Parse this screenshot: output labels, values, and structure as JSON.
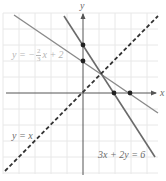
{
  "diagram": {
    "type": "coordinate-plane-linear-graphs",
    "axes": {
      "x_label": "x",
      "y_label": "y"
    },
    "grid": {
      "on": true,
      "color": "#e6e6e6"
    },
    "colors": {
      "axis": "#555555",
      "line_solid": "#6a6a6a",
      "line_dashed": "#333333",
      "point": "#222222"
    },
    "lines": [
      {
        "id": "line1",
        "equation_label": {
          "prefix": "y = −",
          "frac_num": "2",
          "frac_den": "3",
          "suffix": "x + 2"
        },
        "style": "solid",
        "slope": -0.6667,
        "intercept": 2
      },
      {
        "id": "line2",
        "equation_label": "3x + 2y = 6",
        "style": "solid",
        "slope": -1.5,
        "intercept": 3
      },
      {
        "id": "line3",
        "equation_label": "y = x",
        "style": "dashed",
        "slope": 1,
        "intercept": 0
      }
    ],
    "points": [
      {
        "x": 0,
        "y": 3
      },
      {
        "x": 0,
        "y": 2
      },
      {
        "x": 2,
        "y": 0
      },
      {
        "x": 3,
        "y": 0
      }
    ]
  }
}
